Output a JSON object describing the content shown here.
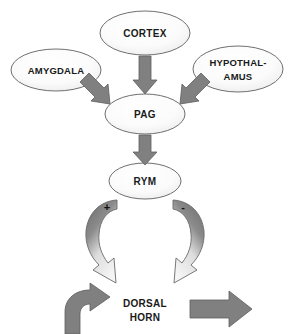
{
  "diagram": {
    "canvas": {
      "width": 290,
      "height": 334,
      "background": "#ffffff"
    },
    "colors": {
      "node_fill_light": "#f7f7f7",
      "node_fill_dark": "#e2e2e2",
      "node_stroke": "#6f6f6f",
      "arrow_gray": "#808080",
      "arrow_dark": "#6e6e6e",
      "arrow_light": "#f0f0f0",
      "text": "#1a1a1a"
    },
    "nodes": [
      {
        "id": "cortex",
        "label": "CORTEX",
        "lines": [
          "CORTEX"
        ],
        "cx": 145,
        "cy": 33,
        "rx": 45,
        "ry": 22
      },
      {
        "id": "amygdala",
        "label": "AMYGDALA",
        "lines": [
          "AMYGDALA"
        ],
        "cx": 56,
        "cy": 70,
        "rx": 45,
        "ry": 21
      },
      {
        "id": "hypothalamus",
        "label": "HYPOTHAL-AMUS",
        "lines": [
          "HYPOTHAL-",
          "AMUS"
        ],
        "cx": 238,
        "cy": 69,
        "rx": 45,
        "ry": 23
      },
      {
        "id": "pag",
        "label": "PAG",
        "lines": [
          "PAG"
        ],
        "cx": 145,
        "cy": 114,
        "rx": 40,
        "ry": 20
      },
      {
        "id": "rym",
        "label": "RYM",
        "lines": [
          "RYM"
        ],
        "cx": 145,
        "cy": 181,
        "rx": 36,
        "ry": 18
      }
    ],
    "edges": [
      {
        "id": "cortex-to-pag",
        "from": "cortex",
        "to": "pag",
        "kind": "straight-down",
        "sign": ""
      },
      {
        "id": "amygdala-to-pag",
        "from": "amygdala",
        "to": "pag",
        "kind": "diagonal-down-right",
        "sign": ""
      },
      {
        "id": "hypothalamus-to-pag",
        "from": "hypothalamus",
        "to": "pag",
        "kind": "diagonal-down-left",
        "sign": ""
      },
      {
        "id": "pag-to-rym",
        "from": "pag",
        "to": "rym",
        "kind": "straight-down",
        "sign": ""
      },
      {
        "id": "rym-to-dorsal-horn-left",
        "from": "rym",
        "to": "dorsal-horn",
        "kind": "curved-down-left",
        "sign": "+"
      },
      {
        "id": "rym-to-dorsal-horn-right",
        "from": "rym",
        "to": "dorsal-horn",
        "kind": "curved-down-right",
        "sign": "-"
      }
    ],
    "signs": {
      "excitatory": "+",
      "inhibitory": "-"
    },
    "output": {
      "id": "dorsal-horn",
      "lines": [
        "DORSAL",
        "HORN"
      ],
      "label": "DORSAL HORN",
      "cx": 145,
      "cy": 311,
      "left_arrow": {
        "name": "bent-arrow-right",
        "direction": "right"
      },
      "right_arrow": {
        "name": "block-arrow-right",
        "direction": "right"
      }
    }
  }
}
